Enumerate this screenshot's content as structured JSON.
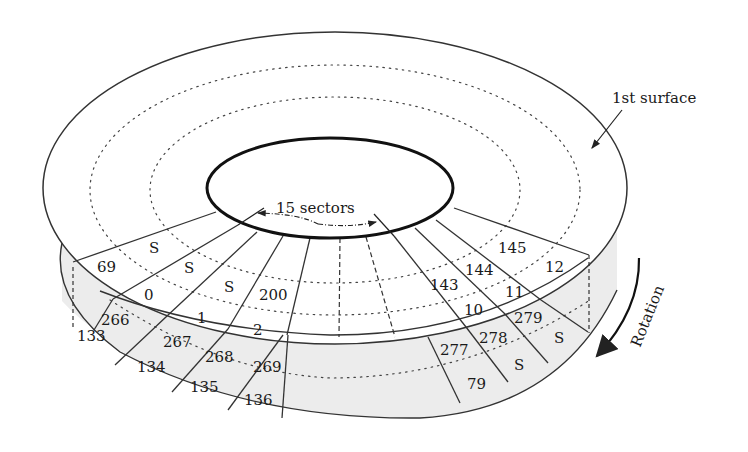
{
  "diagram": {
    "type": "disk-surface-sectors",
    "labels": {
      "surface": "1st surface",
      "sectors": "15 sectors",
      "rotation": "Rotation"
    },
    "colors": {
      "line": "#222222",
      "shade": "#ececec",
      "background": "#ffffff"
    },
    "top_sectors": {
      "outer_row": [
        "69",
        "0",
        "1",
        "2"
      ],
      "inner_row": [
        "S",
        "S",
        "S",
        "200"
      ],
      "right_outer_row": [
        "10",
        "11",
        "12"
      ],
      "right_inner_row": [
        "143",
        "144",
        "145"
      ]
    },
    "rim_sectors": {
      "upper_row": [
        "266",
        "267",
        "268",
        "269",
        "277",
        "278",
        "279"
      ],
      "lower_row": [
        "133",
        "134",
        "135",
        "136",
        "79",
        "S",
        "S"
      ]
    }
  }
}
